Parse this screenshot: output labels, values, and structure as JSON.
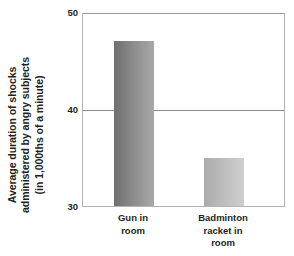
{
  "chart_data": {
    "type": "bar",
    "title": "",
    "subtitle": "",
    "xlabel": "",
    "ylabel": "Average duration of shocks administered by angry subjects (in 1,000ths of a minute)",
    "ylabel_lines": [
      "Average duration of shocks",
      "administered by angry subjects",
      "(in 1,000ths of a minute)"
    ],
    "categories": [
      "Gun in room",
      "Badminton racket in room"
    ],
    "category_label_lines": [
      [
        "Gun in",
        "room"
      ],
      [
        "Badminton",
        "racket in",
        "room"
      ]
    ],
    "values": [
      47,
      35
    ],
    "ylim": [
      30,
      50
    ],
    "yticks": [
      30,
      40,
      50
    ],
    "ytick_labels": [
      "30",
      "40",
      "50"
    ],
    "grid": true,
    "gridlines": [
      40
    ],
    "legend": false,
    "legend_position": "none",
    "bar_colors": [
      "#7b7b7b",
      "#b4b4b4"
    ],
    "bar_gradients": [
      [
        "#6f6f6f",
        "#8a8a8a",
        "#a8a8a8"
      ],
      [
        "#ababab",
        "#bcbcbc",
        "#cfcfcf"
      ]
    ],
    "axis_color": "#b3b3b3",
    "gridline_color": "#8c8c8c",
    "text_color": "#231f20",
    "background": "#ffffff"
  }
}
